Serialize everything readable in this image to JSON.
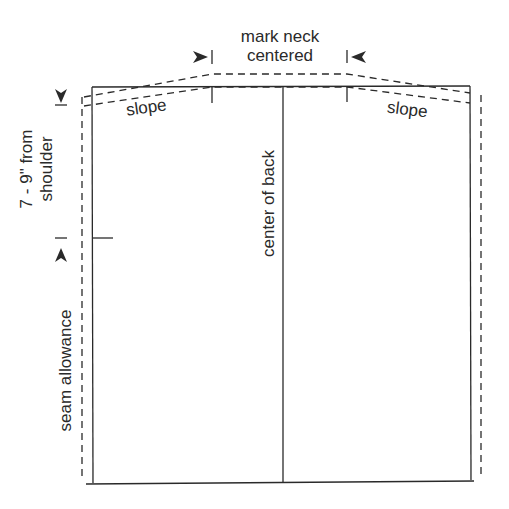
{
  "diagram": {
    "type": "sewing-pattern",
    "title_annotation": {
      "line1": "mark neck",
      "line2": "centered"
    },
    "labels": {
      "slope_left": "slope",
      "slope_right": "slope",
      "center_of_back": "center of back",
      "shoulder_measure_line1": "7 - 9\" from",
      "shoulder_measure_line2": "shoulder",
      "seam_allowance": "seam allowance"
    },
    "colors": {
      "line": "#2a2a2a",
      "background": "#ffffff"
    }
  }
}
